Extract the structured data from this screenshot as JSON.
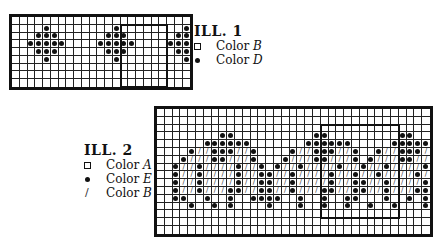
{
  "ill1": {
    "title": "ILL. 1",
    "legend": [
      {
        "symbol": "open-square",
        "label": "Color",
        "letter": "B"
      },
      {
        "symbol": "dot",
        "label": "Color",
        "letter": "D"
      }
    ],
    "grid": {
      "cols": 23,
      "rows": 9,
      "cell_px": 7.75,
      "cells": [
        ".......................",
        "....D........D........D",
        "...DDD......DDD......DD",
        "..DDDDD....DDDDD....DDD",
        "...DDD......DDD......DD",
        "....D........D........D",
        ".......................",
        ".......................",
        "......................."
      ]
    },
    "repeat_frame": {
      "col": 14,
      "row": 1,
      "cols": 6,
      "rows": 8
    }
  },
  "ill2": {
    "title": "ILL. 2",
    "legend": [
      {
        "symbol": "open-square",
        "label": "Color",
        "letter": "A"
      },
      {
        "symbol": "dot",
        "label": "Color",
        "letter": "E"
      },
      {
        "symbol": "slash",
        "label": "Color",
        "letter": "B"
      }
    ],
    "grid": {
      "cols": 35,
      "rows": 16,
      "cell_px": 7.8,
      "cells": [
        "...................................",
        "...................................",
        "...................................",
        "........DD..........DD.........DD..",
        "......DDDDDD.......DDDDDD.....DDDDD",
        "....D//DDD//D....D//DDD//D..D//DDD/",
        "...D///DD///D...D///DD///D.D///DD//",
        "..D//D////D//D.D//D////D//D//D////D",
        "..D//D////D//DD//D////D//D//D////D/",
        "..D//D////D//DD//D////D//DD//D////D",
        "..D//D///DD//DD//D///DD//DD//D///DD",
        "..DD..D..D..DDDD..D..D..DD...D..D.D",
        "....D..D.D....D...D..D..D..D..D...D",
        "...................................",
        "...................................",
        "..................................."
      ]
    },
    "repeat_frame": {
      "col": 21,
      "row": 2,
      "cols": 10,
      "rows": 12
    }
  }
}
